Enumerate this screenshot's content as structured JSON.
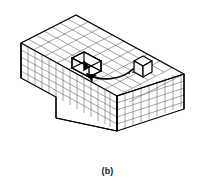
{
  "figure": {
    "caption": "(b)",
    "title": "",
    "kind": "isometric-voxel-block-diagram",
    "colors": {
      "background": "#ffffff",
      "outline": "#000000",
      "grid": "#4a4a4a",
      "grid_light": "#707070",
      "arrow": "#000000",
      "caption": "#1a1a1a"
    },
    "geometry": {
      "top_face_grid_cols": 11,
      "top_face_grid_rows": 8,
      "front_face_grid_cols": 11,
      "front_face_grid_rows": 5,
      "right_face_grid_cols": 8,
      "right_face_grid_rows": 5,
      "left_face_grid_cols": 8,
      "left_face_grid_rows": 5,
      "notch_cells": 2,
      "detached_cubes": 1,
      "projection": "isometric"
    },
    "labels": {
      "notch": "notch",
      "detached_cube": "removed unit cube",
      "arrow": "insertion arrow"
    }
  }
}
